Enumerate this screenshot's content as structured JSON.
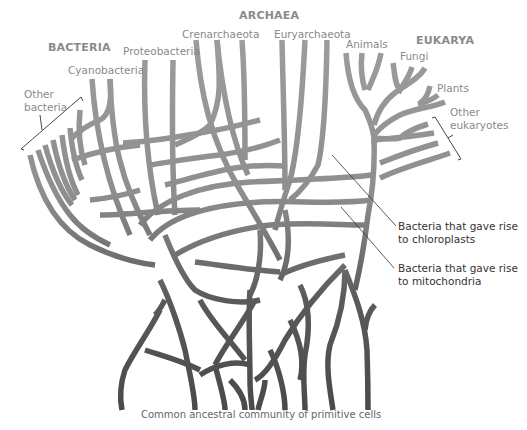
{
  "diagram": {
    "domains": {
      "bacteria": "BACTERIA",
      "archaea": "ARCHAEA",
      "eukarya": "EUKARYA"
    },
    "groups": {
      "other_bacteria_line1": "Other",
      "other_bacteria_line2": "bacteria",
      "cyanobacteria": "Cyanobacteria",
      "proteobacteria": "Proteobacteria",
      "crenarchaeota": "Crenarchaeota",
      "euryarchaeota": "Euryarchaeota",
      "animals": "Animals",
      "fungi": "Fungi",
      "plants": "Plants",
      "other_eukaryotes_line1": "Other",
      "other_eukaryotes_line2": "eukaryotes"
    },
    "annotations": {
      "chloroplasts_line1": "Bacteria that gave rise",
      "chloroplasts_line2": "to chloroplasts",
      "mitochondria_line1": "Bacteria that gave rise",
      "mitochondria_line2": "to mitochondria"
    },
    "root_label": "Common ancestral community of primitive cells",
    "colors": {
      "branch_top": "#9a9a9a",
      "branch_bottom": "#4a4a4a",
      "label_gray": "#8a8a8a",
      "annotation_text": "#333333"
    }
  }
}
